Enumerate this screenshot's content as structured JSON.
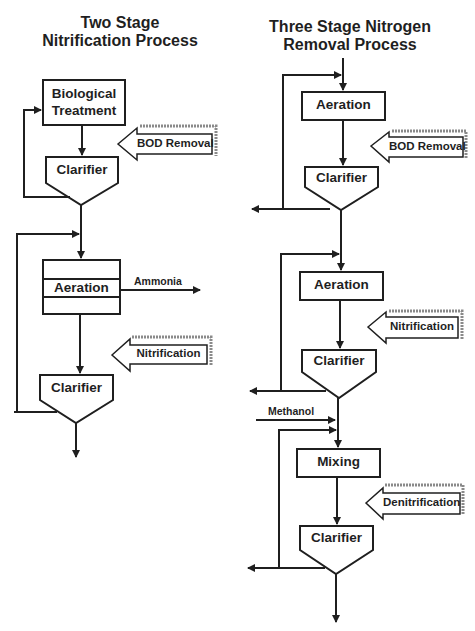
{
  "left_diagram": {
    "title_line1": "Two Stage",
    "title_line2": "Nitrification Process",
    "units": [
      {
        "label_line1": "Biological",
        "label_line2": "Treatment",
        "shape": "box"
      },
      {
        "label": "Clarifier",
        "shape": "clarifier"
      },
      {
        "label": "Aeration",
        "shape": "box-with-baffles"
      },
      {
        "label": "Clarifier",
        "shape": "clarifier"
      }
    ],
    "stage_arrows": [
      {
        "label": "BOD Removal"
      },
      {
        "label": "Nitrification"
      }
    ],
    "side_streams": [
      {
        "label": "Ammonia",
        "direction": "out"
      }
    ]
  },
  "right_diagram": {
    "title_line1": "Three Stage Nitrogen",
    "title_line2": "Removal Process",
    "units": [
      {
        "label": "Aeration",
        "shape": "box"
      },
      {
        "label": "Clarifier",
        "shape": "clarifier"
      },
      {
        "label": "Aeration",
        "shape": "box"
      },
      {
        "label": "Clarifier",
        "shape": "clarifier"
      },
      {
        "label": "Mixing",
        "shape": "box"
      },
      {
        "label": "Clarifier",
        "shape": "clarifier"
      }
    ],
    "stage_arrows": [
      {
        "label": "BOD Removal"
      },
      {
        "label": "Nitrification"
      },
      {
        "label": "Denitrification"
      }
    ],
    "side_streams": [
      {
        "label": "Methanol",
        "direction": "in"
      }
    ]
  },
  "colors": {
    "line": "#1f1f1f",
    "background": "#ffffff",
    "shadow": "#8a8a8a"
  }
}
